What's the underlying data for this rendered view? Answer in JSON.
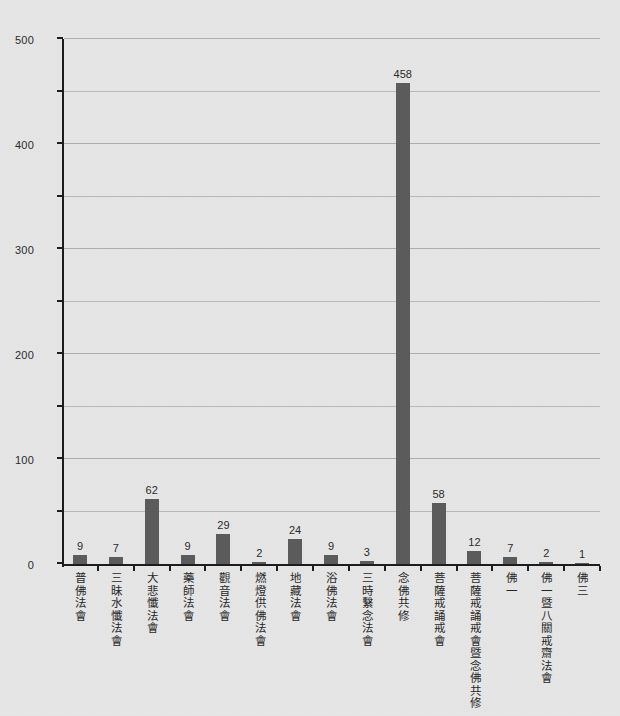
{
  "chart_data": {
    "type": "bar",
    "title": "",
    "subtitle": "",
    "xlabel": "",
    "ylabel": "",
    "ylim": [
      0,
      500
    ],
    "y_major_ticks": [
      0,
      100,
      200,
      300,
      400,
      500
    ],
    "y_minor_ticks": [
      50,
      150,
      250,
      350,
      450
    ],
    "grid": true,
    "legend": "none",
    "bar_color": "#5b5b5b",
    "axis_color": "#1c1c1c",
    "grid_color": "#b9b9b9",
    "background_color": "#e6e6e6",
    "categories": [
      "普佛法會",
      "三昧水懺法會",
      "大悲懺法會",
      "藥師法會",
      "觀音法會",
      "燃燈供佛法會",
      "地藏法會",
      "浴佛法會",
      "三時繫念法會",
      "念佛共修",
      "菩薩戒誦戒會",
      "菩薩戒誦戒會暨念佛共修",
      "佛一",
      "佛一暨八關戒齋法會",
      "佛三"
    ],
    "values": [
      9,
      7,
      62,
      9,
      29,
      2,
      24,
      9,
      3,
      458,
      58,
      12,
      7,
      2,
      1
    ]
  }
}
